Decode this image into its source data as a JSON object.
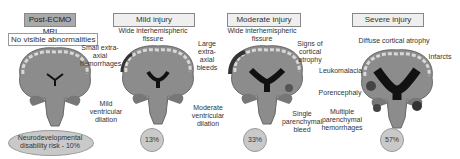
{
  "panels": [
    {
      "title": "Post-ECMO MRI",
      "subtitle": "No visible abnormalities",
      "labels": [
        "Small extra-axial hemorrhages",
        "Mild ventricular dilation"
      ],
      "footer": "Neurodevelopmental disability risk - 10%"
    },
    {
      "title": "Mild injury",
      "subtitle": "Wide interhemispheric fissure",
      "labels": [
        "Large extra-axial bleeds",
        "Moderate ventricular dilation"
      ],
      "percent": "13%"
    },
    {
      "title": "Moderate injury",
      "subtitle": "Wide interhemispheric fissure",
      "labels": [
        "Signs of cortical atrophy",
        "Single parenchymal bleed"
      ],
      "percent": "33%"
    },
    {
      "title": "Severe injury",
      "subtitle": "Diffuse cortical atrophy",
      "labels": [
        "Infarcts",
        "Leukomalacia",
        "Porencephaly",
        "Multiple parenchymal hemorrhages"
      ],
      "percent": "57%"
    }
  ],
  "colors": {
    "brain": "#8c8c8c",
    "cortex_edge": "#cfcfcf",
    "ventricle": "#111111",
    "pct_fill": "#c9c9c9"
  }
}
